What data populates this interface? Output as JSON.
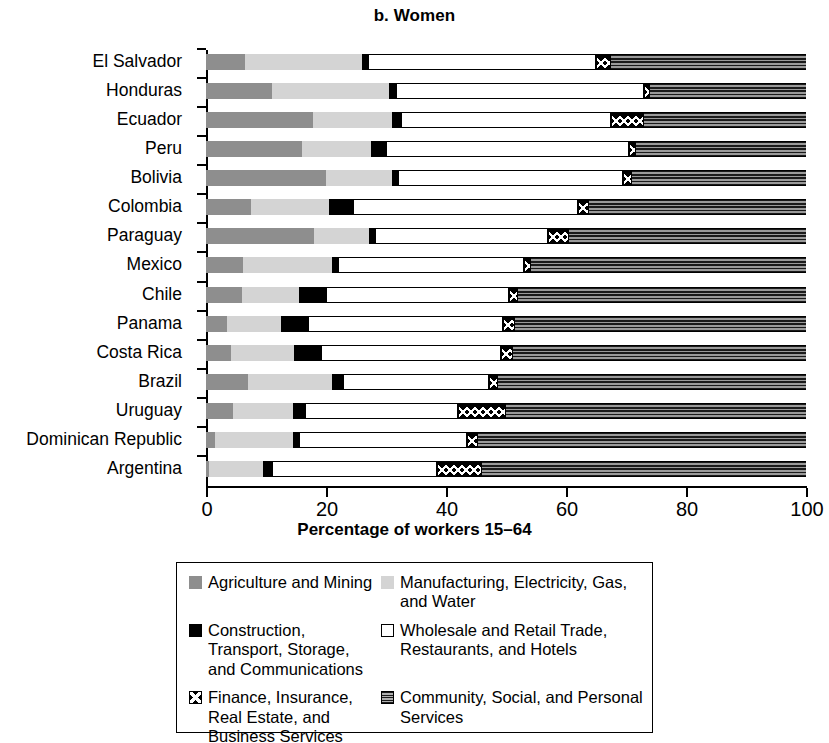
{
  "chart_data": {
    "type": "bar",
    "subtype": "stacked-horizontal-100",
    "title": "b. Women",
    "xlabel": "Percentage of workers 15–64",
    "ylabel": "",
    "xlim": [
      0,
      100
    ],
    "xticks": [
      0,
      20,
      40,
      60,
      80,
      100
    ],
    "xticklabels": [
      "0",
      "20",
      "40",
      "60",
      "80",
      "100"
    ],
    "grid": false,
    "legend_position": "bottom",
    "categories": [
      "El Salvador",
      "Honduras",
      "Ecuador",
      "Peru",
      "Bolivia",
      "Colombia",
      "Paraguay",
      "Mexico",
      "Chile",
      "Panama",
      "Costa Rica",
      "Brazil",
      "Uruguay",
      "Dominican Republic",
      "Argentina"
    ],
    "series": [
      {
        "name": "Agriculture and Mining",
        "key": "agri",
        "fill": "solid-dark-gray",
        "color": "#8e8e8e",
        "values": [
          6.5,
          11.0,
          17.8,
          16.0,
          20.0,
          7.5,
          18.0,
          6.2,
          6.0,
          3.5,
          4.2,
          7.0,
          4.5,
          1.5,
          0.5
        ]
      },
      {
        "name": "Manufacturing, Electricity, Gas, and Water",
        "key": "manu",
        "fill": "solid-light-gray",
        "color": "#d4d4d4",
        "values": [
          19.5,
          19.5,
          13.2,
          11.5,
          11.0,
          13.0,
          9.2,
          14.8,
          9.5,
          9.0,
          10.5,
          14.0,
          10.0,
          13.0,
          9.0
        ]
      },
      {
        "name": "Construction, Transport, Storage, and Communications",
        "key": "cons",
        "fill": "solid-black",
        "color": "#000000",
        "values": [
          1.0,
          1.2,
          1.5,
          2.5,
          1.0,
          4.0,
          1.0,
          1.0,
          4.5,
          4.5,
          4.5,
          1.8,
          2.0,
          1.0,
          1.5
        ]
      },
      {
        "name": "Wholesale and Retail Trade, Restaurants, and Hotels",
        "key": "whole",
        "fill": "white-outline",
        "color": "#ffffff",
        "values": [
          38.0,
          41.3,
          35.0,
          40.5,
          37.5,
          37.5,
          28.8,
          31.0,
          30.5,
          32.5,
          30.0,
          24.4,
          25.5,
          28.0,
          27.5
        ]
      },
      {
        "name": "Finance, Insurance, Real Estate, and Business Services",
        "key": "fin",
        "fill": "checkered-x",
        "color": "#000000",
        "values": [
          2.5,
          1.0,
          5.5,
          1.2,
          1.5,
          1.8,
          3.5,
          1.2,
          1.5,
          2.0,
          2.0,
          1.5,
          8.0,
          1.8,
          7.5
        ]
      },
      {
        "name": "Community, Social, and Personal Services",
        "key": "comm",
        "fill": "horizontal-hatch",
        "color": "#9a9a9a",
        "values": [
          32.5,
          26.0,
          27.0,
          28.3,
          29.0,
          36.2,
          39.5,
          45.8,
          48.0,
          48.5,
          48.8,
          51.3,
          50.0,
          54.7,
          54.0
        ]
      }
    ]
  },
  "legend": {
    "items": [
      {
        "label": "Agriculture and Mining",
        "key": "agri"
      },
      {
        "label": "Manufacturing, Electricity, Gas, and Water",
        "key": "manu"
      },
      {
        "label": "Construction, Transport, Storage, and Communications",
        "key": "cons"
      },
      {
        "label": "Wholesale and Retail Trade, Restaurants, and Hotels",
        "key": "whole"
      },
      {
        "label": "Finance, Insurance, Real Estate, and Business Services",
        "key": "fin"
      },
      {
        "label": "Community, Social, and Personal Services",
        "key": "comm"
      }
    ]
  }
}
